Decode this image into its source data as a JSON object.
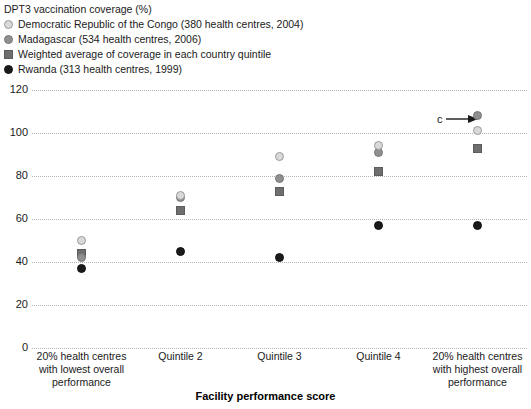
{
  "legend": {
    "title": "DPT3 vaccination coverage (%)",
    "entries": [
      {
        "label": "Democratic Republic of the Congo (380 health centres, 2004)",
        "marker": "circle-light",
        "color": "#d9d9d9"
      },
      {
        "label": "Madagascar (534 health centres, 2006)",
        "marker": "circle-mid",
        "color": "#8f8f8f"
      },
      {
        "label": "Weighted average of coverage in each country quintile",
        "marker": "square-dark",
        "color": "#6e6e6e"
      },
      {
        "label": "Rwanda (313 health centres, 1999)",
        "marker": "circle-black",
        "color": "#1a1a1a"
      }
    ]
  },
  "annotation": {
    "text": "c",
    "arrow_icon": "arrow-right-icon"
  },
  "chart_data": {
    "type": "scatter",
    "title": "DPT3 vaccination coverage (%)",
    "xlabel": "Facility performance score",
    "ylabel": "DPT3 vaccination coverage (%)",
    "ylim": [
      0,
      120
    ],
    "yticks": [
      0,
      20,
      40,
      60,
      80,
      100,
      120
    ],
    "grid": true,
    "legend_position": "above-plot",
    "categories": [
      "20% health centres with lowest overall performance",
      "Quintile 2",
      "Quintile 3",
      "Quintile 4",
      "20% health centres with highest overall performance"
    ],
    "series": [
      {
        "name": "Democratic Republic of the Congo (380 health centres, 2004)",
        "marker": "circle-light",
        "color": "#d9d9d9",
        "values": [
          50,
          71,
          89,
          94,
          101
        ]
      },
      {
        "name": "Madagascar (534 health centres, 2006)",
        "marker": "circle-mid",
        "color": "#8f8f8f",
        "values": [
          42,
          70,
          79,
          91,
          108
        ]
      },
      {
        "name": "Weighted average of coverage in each country quintile",
        "marker": "square-dark",
        "color": "#6e6e6e",
        "values": [
          44,
          64,
          73,
          82,
          93
        ]
      },
      {
        "name": "Rwanda (313 health centres, 1999)",
        "marker": "circle-black",
        "color": "#1a1a1a",
        "values": [
          37,
          45,
          42,
          57,
          57
        ]
      }
    ]
  }
}
